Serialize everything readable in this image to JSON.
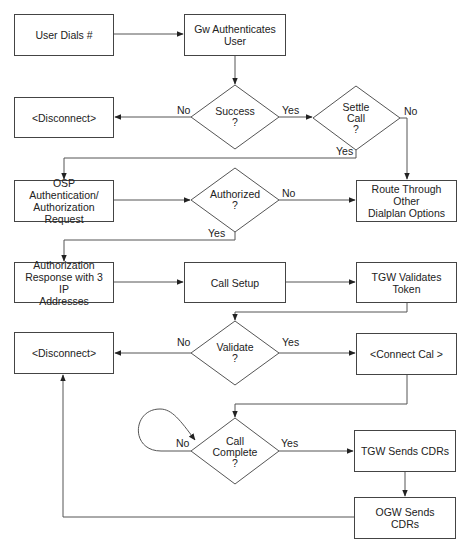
{
  "diagram": {
    "type": "flowchart",
    "nodes": {
      "user_dials": {
        "label": "User Dials #",
        "shape": "process"
      },
      "gw_auth": {
        "label": "Gw Authenticates\nUser",
        "shape": "process"
      },
      "success": {
        "label": "Success\n?",
        "shape": "decision"
      },
      "settle_call": {
        "label": "Settle\nCall\n?",
        "shape": "decision"
      },
      "disconnect_1": {
        "label": "<Disconnect>",
        "shape": "process"
      },
      "osp_request": {
        "label": "OSP Authentication/\nAuthorization Request",
        "shape": "process"
      },
      "authorized": {
        "label": "Authorized\n?",
        "shape": "decision"
      },
      "route_other": {
        "label": "Route Through Other\nDialplan Options",
        "shape": "process"
      },
      "auth_response": {
        "label": "Authorization\nResponse with  3 IP\nAddresses",
        "shape": "process"
      },
      "call_setup": {
        "label": "Call Setup",
        "shape": "process"
      },
      "tgw_validates": {
        "label": "TGW Validates\nToken",
        "shape": "process"
      },
      "validate": {
        "label": "Validate\n?",
        "shape": "decision"
      },
      "disconnect_2": {
        "label": "<Disconnect>",
        "shape": "process"
      },
      "connect_call": {
        "label": "<Connect Cal >",
        "shape": "process"
      },
      "call_complete": {
        "label": "Call\nComplete\n?",
        "shape": "decision"
      },
      "tgw_sends_cdrs": {
        "label": "TGW Sends CDRs",
        "shape": "process"
      },
      "ogw_sends_cdrs": {
        "label": "OGW Sends\nCDRs",
        "shape": "process"
      }
    },
    "edge_labels": {
      "success_no": "No",
      "success_yes": "Yes",
      "settle_no": "No",
      "settle_yes": "Yes",
      "authorized_no": "No",
      "authorized_yes": "Yes",
      "validate_no": "No",
      "validate_yes": "Yes",
      "complete_no": "No",
      "complete_yes": "Yes"
    },
    "edges": [
      {
        "from": "user_dials",
        "to": "gw_auth"
      },
      {
        "from": "gw_auth",
        "to": "success"
      },
      {
        "from": "success",
        "to": "disconnect_1",
        "label": "No"
      },
      {
        "from": "success",
        "to": "settle_call",
        "label": "Yes"
      },
      {
        "from": "settle_call",
        "to": "route_other",
        "label": "No"
      },
      {
        "from": "settle_call",
        "to": "osp_request",
        "label": "Yes"
      },
      {
        "from": "osp_request",
        "to": "authorized"
      },
      {
        "from": "authorized",
        "to": "route_other",
        "label": "No"
      },
      {
        "from": "authorized",
        "to": "auth_response",
        "label": "Yes"
      },
      {
        "from": "auth_response",
        "to": "call_setup"
      },
      {
        "from": "call_setup",
        "to": "tgw_validates"
      },
      {
        "from": "tgw_validates",
        "to": "validate"
      },
      {
        "from": "validate",
        "to": "disconnect_2",
        "label": "No"
      },
      {
        "from": "validate",
        "to": "connect_call",
        "label": "Yes"
      },
      {
        "from": "connect_call",
        "to": "call_complete"
      },
      {
        "from": "call_complete",
        "to": "call_complete",
        "label": "No"
      },
      {
        "from": "call_complete",
        "to": "tgw_sends_cdrs",
        "label": "Yes"
      },
      {
        "from": "tgw_sends_cdrs",
        "to": "ogw_sends_cdrs"
      },
      {
        "from": "ogw_sends_cdrs",
        "to": "disconnect_2"
      }
    ],
    "colors": {
      "stroke": "#444444",
      "text": "#222222",
      "background": "#ffffff"
    }
  }
}
